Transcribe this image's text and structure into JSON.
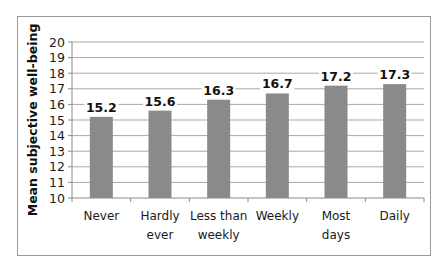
{
  "chart_data": {
    "type": "bar",
    "title": "",
    "xlabel": "",
    "ylabel": "Mean subjective well-being",
    "ylim": [
      10,
      20
    ],
    "yticks": [
      10,
      11,
      12,
      13,
      14,
      15,
      16,
      17,
      18,
      19,
      20
    ],
    "grid": true,
    "legend": null,
    "categories": [
      "Never",
      "Hardly ever",
      "Less than weekly",
      "Weekly",
      "Most days",
      "Daily"
    ],
    "category_lines": [
      [
        "Never"
      ],
      [
        "Hardly",
        "ever"
      ],
      [
        "Less than",
        "weekly"
      ],
      [
        "Weekly"
      ],
      [
        "Most",
        "days"
      ],
      [
        "Daily"
      ]
    ],
    "values": [
      15.2,
      15.6,
      16.3,
      16.7,
      17.2,
      17.3
    ],
    "value_labels": [
      "15.2",
      "15.6",
      "16.3",
      "16.7",
      "17.2",
      "17.3"
    ],
    "colors": {
      "bar": "#8a8a8a",
      "grid": "#a8a8a8",
      "axis": "#8c8c8c",
      "frame": "#9a9a9a"
    }
  }
}
